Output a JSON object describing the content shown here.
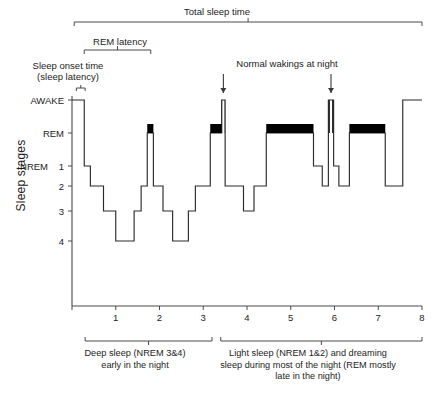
{
  "figure": {
    "y_axis_title": "Sleep stages",
    "annotations": {
      "total_sleep_time": "Total sleep time",
      "rem_latency": "REM latency",
      "sleep_onset": "Sleep onset time\n(sleep latency)",
      "normal_wakings": "Normal wakings at night"
    },
    "captions": {
      "deep_sleep": "Deep sleep (NREM 3&4)\nearly in the night",
      "light_sleep": "Light sleep (NREM 1&2) and dreaming\nsleep during most of the night (REM mostly\nlate in the night)"
    }
  },
  "chart_data": {
    "type": "line",
    "title": "Total sleep time",
    "subtitle": "Hypnogram of a normal night of sleep",
    "xlabel": "",
    "ylabel": "Sleep stages",
    "xlim": [
      0,
      8
    ],
    "ylim_levels": [
      "AWAKE",
      "REM",
      "1",
      "2",
      "3",
      "4"
    ],
    "grid": false,
    "legend": false,
    "x_ticks": [
      0,
      1,
      2,
      3,
      4,
      5,
      6,
      7,
      8
    ],
    "x_tick_labels": [
      "",
      "1",
      "2",
      "3",
      "4",
      "5",
      "6",
      "7",
      "8"
    ],
    "y_ticks": [
      {
        "label": "AWAKE",
        "level": 0,
        "group": "AWAKE"
      },
      {
        "label": "REM",
        "level": 1,
        "group": "REM"
      },
      {
        "label": "1",
        "level": 2,
        "group": "NREM"
      },
      {
        "label": "2",
        "level": 3,
        "group": "NREM"
      },
      {
        "label": "3",
        "level": 4,
        "group": "NREM"
      },
      {
        "label": "4",
        "level": 5,
        "group": "NREM"
      }
    ],
    "y_group_label": "NREM",
    "note": "Step series: each segment is [x_start, x_end, stage_level] where level 0=AWAKE, 1=REM, 2=NREM1, 3=NREM2, 4=NREM3, 5=NREM4",
    "segments": [
      [
        0.0,
        0.28,
        0
      ],
      [
        0.28,
        0.42,
        2
      ],
      [
        0.42,
        0.72,
        3
      ],
      [
        0.72,
        1.0,
        4
      ],
      [
        1.0,
        1.42,
        5
      ],
      [
        1.42,
        1.58,
        4
      ],
      [
        1.58,
        1.72,
        3
      ],
      [
        1.72,
        1.86,
        1
      ],
      [
        1.86,
        2.08,
        3
      ],
      [
        2.08,
        2.3,
        4
      ],
      [
        2.3,
        2.66,
        5
      ],
      [
        2.66,
        2.82,
        4
      ],
      [
        2.82,
        3.16,
        3
      ],
      [
        3.16,
        3.42,
        1
      ],
      [
        3.42,
        3.5,
        0
      ],
      [
        3.5,
        3.92,
        3
      ],
      [
        3.92,
        4.16,
        4
      ],
      [
        4.16,
        4.44,
        3
      ],
      [
        4.44,
        5.52,
        1
      ],
      [
        5.52,
        5.72,
        2
      ],
      [
        5.72,
        5.86,
        3
      ],
      [
        5.86,
        5.98,
        0
      ],
      [
        5.98,
        6.1,
        2
      ],
      [
        6.1,
        6.34,
        3
      ],
      [
        6.34,
        7.16,
        1
      ],
      [
        7.16,
        7.56,
        3
      ],
      [
        7.56,
        8.0,
        0
      ]
    ],
    "rem_periods": [
      {
        "start": 1.72,
        "end": 1.86,
        "label": "REM period 1"
      },
      {
        "start": 3.16,
        "end": 3.42,
        "label": "REM period 2"
      },
      {
        "start": 4.44,
        "end": 5.52,
        "label": "REM period 3"
      },
      {
        "start": 6.34,
        "end": 7.16,
        "label": "REM period 4"
      }
    ],
    "wake_spikes": [
      {
        "x": 3.46,
        "label": "Normal waking 1"
      },
      {
        "x": 5.92,
        "label": "Normal waking 2"
      }
    ],
    "brackets": [
      {
        "name": "total_sleep_time",
        "label": "Total sleep time",
        "x_start": 0.05,
        "x_end": 8.0
      },
      {
        "name": "rem_latency",
        "label": "REM latency",
        "x_start": 0.28,
        "x_end": 1.8
      },
      {
        "name": "sleep_onset",
        "label": "Sleep onset time (sleep latency)",
        "x_start": 0.1,
        "x_end": 0.3
      },
      {
        "name": "deep_sleep",
        "label": "Deep sleep (NREM 3&4) early in the night",
        "x_start": 0.3,
        "x_end": 3.2
      },
      {
        "name": "light_sleep",
        "label": "Light sleep (NREM 1&2) and dreaming sleep during most of the night (REM mostly late in the night)",
        "x_start": 3.4,
        "x_end": 8.0
      }
    ]
  },
  "colors": {
    "line": "#2b2b2b",
    "rem_fill": "#000000",
    "axis": "#4a4a4a",
    "text": "#1c1c1c",
    "background": "#ffffff"
  }
}
